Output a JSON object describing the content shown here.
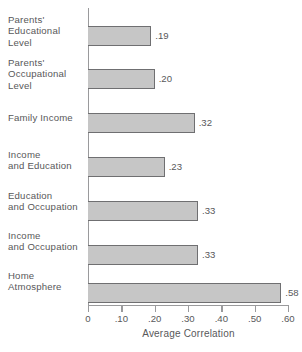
{
  "chart_data": {
    "type": "bar",
    "orientation": "horizontal",
    "title": "",
    "xlabel": "Average Correlation",
    "ylabel": "",
    "xlim": [
      0,
      0.6
    ],
    "xticks": [
      "0",
      ".10",
      ".20",
      ".30",
      ".40",
      ".50",
      ".60"
    ],
    "xtick_values": [
      0,
      0.1,
      0.2,
      0.3,
      0.4,
      0.5,
      0.6
    ],
    "grid": false,
    "legend": null,
    "bar_color": "#c6c6c6",
    "bar_border_color": "#6f6f71",
    "axis_color": "#9a9a9c",
    "text_color": "#58585a",
    "categories": [
      "Parents'\nEducational\nLevel",
      "Parents'\nOccupational\nLevel",
      "Family Income",
      "Income\nand Education",
      "Education\nand Occupation",
      "Income\nand Occupation",
      "Home\nAtmosphere"
    ],
    "values": [
      0.19,
      0.2,
      0.32,
      0.23,
      0.33,
      0.33,
      0.58
    ],
    "value_labels": [
      ".19",
      ".20",
      ".32",
      ".23",
      ".33",
      ".33",
      ".58"
    ]
  }
}
